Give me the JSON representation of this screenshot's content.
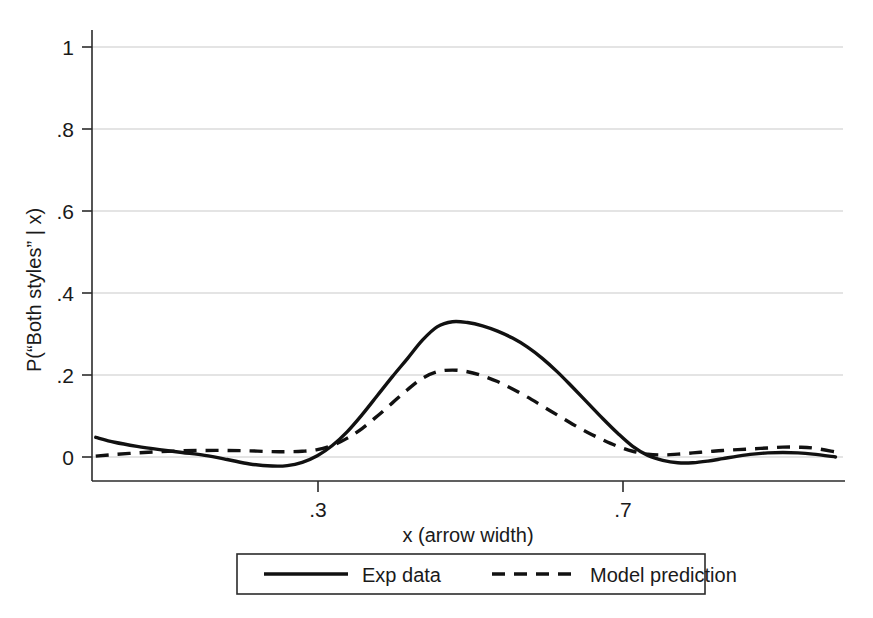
{
  "chart_data": {
    "type": "line",
    "title": "",
    "subtitle": "",
    "xlabel": "x (arrow width)",
    "ylabel": "P(“Both styles” | x)",
    "xlim": [
      0.0,
      1.0
    ],
    "ylim": [
      -0.06,
      1.0
    ],
    "xticks": [
      0.3,
      0.7
    ],
    "xtick_labels": [
      ".3",
      ".7"
    ],
    "yticks": [
      0,
      0.2,
      0.4,
      0.6,
      0.8,
      1.0
    ],
    "ytick_labels": [
      "0",
      ".2",
      ".4",
      ".6",
      ".8",
      "1"
    ],
    "grid": "horizontal",
    "grid_color": "#c9c9c9",
    "legend_position": "below-axis",
    "line_color": "#111111",
    "series": [
      {
        "name": "Exp data",
        "style": "solid",
        "x": [
          0.005,
          0.03,
          0.06,
          0.09,
          0.12,
          0.15,
          0.18,
          0.21,
          0.24,
          0.26,
          0.28,
          0.3,
          0.32,
          0.34,
          0.36,
          0.38,
          0.4,
          0.42,
          0.44,
          0.46,
          0.48,
          0.5,
          0.52,
          0.54,
          0.56,
          0.58,
          0.6,
          0.62,
          0.64,
          0.66,
          0.68,
          0.7,
          0.72,
          0.74,
          0.76,
          0.78,
          0.8,
          0.82,
          0.84,
          0.86,
          0.88,
          0.9,
          0.92,
          0.94,
          0.96,
          0.99
        ],
        "y": [
          0.048,
          0.036,
          0.026,
          0.018,
          0.011,
          0.004,
          -0.006,
          -0.017,
          -0.022,
          -0.021,
          -0.013,
          0.003,
          0.028,
          0.062,
          0.104,
          0.15,
          0.196,
          0.24,
          0.285,
          0.318,
          0.33,
          0.328,
          0.32,
          0.307,
          0.29,
          0.268,
          0.24,
          0.207,
          0.17,
          0.132,
          0.094,
          0.058,
          0.026,
          0.004,
          -0.008,
          -0.014,
          -0.014,
          -0.01,
          -0.004,
          0.002,
          0.007,
          0.01,
          0.011,
          0.01,
          0.007,
          0.0
        ]
      },
      {
        "name": "Model prediction",
        "style": "dashed",
        "x": [
          0.005,
          0.03,
          0.06,
          0.09,
          0.12,
          0.15,
          0.18,
          0.21,
          0.24,
          0.26,
          0.28,
          0.3,
          0.32,
          0.34,
          0.36,
          0.38,
          0.4,
          0.42,
          0.44,
          0.46,
          0.48,
          0.5,
          0.52,
          0.54,
          0.56,
          0.58,
          0.6,
          0.62,
          0.64,
          0.66,
          0.68,
          0.7,
          0.72,
          0.74,
          0.76,
          0.78,
          0.8,
          0.82,
          0.84,
          0.86,
          0.88,
          0.9,
          0.92,
          0.94,
          0.96,
          0.99
        ],
        "y": [
          0.002,
          0.006,
          0.01,
          0.013,
          0.015,
          0.016,
          0.016,
          0.015,
          0.013,
          0.013,
          0.014,
          0.018,
          0.028,
          0.046,
          0.07,
          0.1,
          0.132,
          0.164,
          0.192,
          0.208,
          0.212,
          0.208,
          0.198,
          0.184,
          0.166,
          0.146,
          0.124,
          0.102,
          0.08,
          0.06,
          0.042,
          0.026,
          0.014,
          0.007,
          0.005,
          0.007,
          0.01,
          0.013,
          0.016,
          0.018,
          0.02,
          0.022,
          0.024,
          0.024,
          0.022,
          0.012
        ]
      }
    ]
  },
  "legend": {
    "items": [
      {
        "label": "Exp data",
        "style": "solid"
      },
      {
        "label": "Model prediction",
        "style": "dashed"
      }
    ]
  },
  "axes": {
    "y_title": "P(“Both styles” | x)",
    "x_title": "x (arrow width)",
    "y_tick_labels": [
      "1",
      ".8",
      ".6",
      ".4",
      ".2",
      "0"
    ],
    "x_tick_labels": [
      ".3",
      ".7"
    ]
  }
}
